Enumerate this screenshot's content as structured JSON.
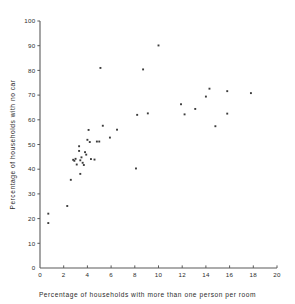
{
  "chart_data": {
    "type": "scatter",
    "title": "",
    "xlabel": "Percentage of households with more than one person per room",
    "ylabel": "Percentage of households with no car",
    "xlim": [
      0,
      20
    ],
    "ylim": [
      0,
      100
    ],
    "xticks": [
      0,
      2,
      4,
      6,
      8,
      10,
      12,
      14,
      16,
      18,
      20
    ],
    "yticks": [
      0,
      10,
      20,
      30,
      40,
      50,
      60,
      70,
      80,
      90,
      100
    ],
    "xtick_labels": [
      "0",
      "2",
      "4",
      "6",
      "8",
      "10",
      "12",
      "14",
      "16",
      "18",
      "20"
    ],
    "ytick_labels": [
      "0",
      "10",
      "20",
      "30",
      "40",
      "50",
      "60",
      "70",
      "80",
      "90",
      "100"
    ],
    "grid": false,
    "legend": false,
    "marker": "square",
    "marker_color": "#3c3c3c",
    "points": [
      {
        "x": 0.7,
        "y": 22.0
      },
      {
        "x": 0.7,
        "y": 18.2
      },
      {
        "x": 2.3,
        "y": 25.1
      },
      {
        "x": 2.6,
        "y": 35.7
      },
      {
        "x": 2.8,
        "y": 43.8
      },
      {
        "x": 2.9,
        "y": 43.4
      },
      {
        "x": 3.0,
        "y": 44.2
      },
      {
        "x": 3.1,
        "y": 41.9
      },
      {
        "x": 3.3,
        "y": 49.3
      },
      {
        "x": 3.3,
        "y": 47.4
      },
      {
        "x": 3.4,
        "y": 43.6
      },
      {
        "x": 3.4,
        "y": 38.1
      },
      {
        "x": 3.5,
        "y": 44.8
      },
      {
        "x": 3.6,
        "y": 42.6
      },
      {
        "x": 3.7,
        "y": 41.7
      },
      {
        "x": 3.8,
        "y": 46.9
      },
      {
        "x": 3.9,
        "y": 45.9
      },
      {
        "x": 4.0,
        "y": 51.9
      },
      {
        "x": 4.1,
        "y": 55.9
      },
      {
        "x": 4.2,
        "y": 51.0
      },
      {
        "x": 4.3,
        "y": 44.1
      },
      {
        "x": 4.6,
        "y": 43.9
      },
      {
        "x": 4.8,
        "y": 51.2
      },
      {
        "x": 5.0,
        "y": 51.2
      },
      {
        "x": 5.1,
        "y": 81.0
      },
      {
        "x": 5.3,
        "y": 57.6
      },
      {
        "x": 5.9,
        "y": 52.8
      },
      {
        "x": 6.5,
        "y": 56.0
      },
      {
        "x": 8.1,
        "y": 40.3
      },
      {
        "x": 8.2,
        "y": 62.0
      },
      {
        "x": 8.7,
        "y": 80.4
      },
      {
        "x": 9.1,
        "y": 62.6
      },
      {
        "x": 10.0,
        "y": 90.1
      },
      {
        "x": 11.9,
        "y": 66.3
      },
      {
        "x": 12.2,
        "y": 62.2
      },
      {
        "x": 13.1,
        "y": 64.4
      },
      {
        "x": 14.0,
        "y": 69.4
      },
      {
        "x": 14.3,
        "y": 72.6
      },
      {
        "x": 14.8,
        "y": 57.4
      },
      {
        "x": 15.8,
        "y": 71.6
      },
      {
        "x": 15.8,
        "y": 62.5
      },
      {
        "x": 17.8,
        "y": 70.8
      }
    ]
  }
}
